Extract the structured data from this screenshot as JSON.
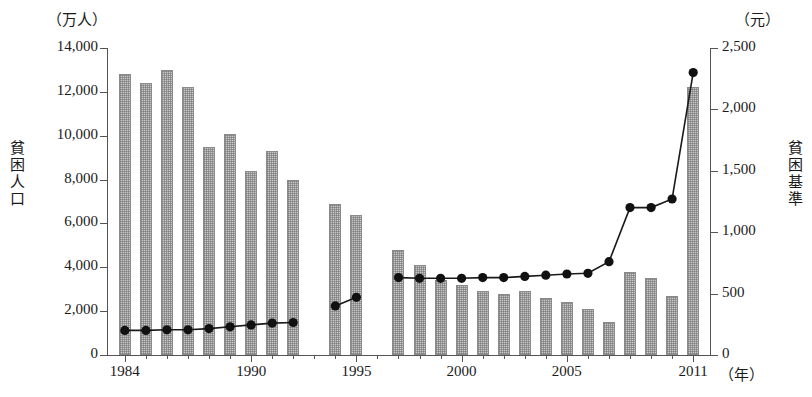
{
  "axes": {
    "left_unit": "（万人）",
    "right_unit": "（元）",
    "left_title": "貧困人口",
    "right_title": "貧困基準",
    "x_unit": "（年）",
    "left_ticks": [
      "14,000",
      "12,000",
      "10,000",
      "8,000",
      "6,000",
      "4,000",
      "2,000",
      "0"
    ],
    "right_ticks": [
      "2,500",
      "2,000",
      "1,500",
      "1,000",
      "500",
      "0"
    ],
    "x_ticks": [
      "1984",
      "1990",
      "1995",
      "2000",
      "2005",
      "2011"
    ]
  },
  "chart_data": {
    "type": "bar",
    "title": "",
    "xlabel": "年",
    "ylabel": "貧困人口",
    "y2label": "貧困基準",
    "ylim": [
      0,
      14000
    ],
    "y2lim": [
      0,
      2500
    ],
    "grid": false,
    "legend": "none",
    "x": [
      1984,
      1985,
      1986,
      1987,
      1988,
      1989,
      1990,
      1991,
      1992,
      1993,
      1994,
      1995,
      1996,
      1997,
      1998,
      1999,
      2000,
      2001,
      2002,
      2003,
      2004,
      2005,
      2006,
      2007,
      2008,
      2009,
      2010,
      2011
    ],
    "categories": [
      "1984",
      "1985",
      "1986",
      "1987",
      "1988",
      "1989",
      "1990",
      "1991",
      "1992",
      "1993",
      "1994",
      "1995",
      "1996",
      "1997",
      "1998",
      "1999",
      "2000",
      "2001",
      "2002",
      "2003",
      "2004",
      "2005",
      "2006",
      "2007",
      "2008",
      "2009",
      "2010",
      "2011"
    ],
    "series": [
      {
        "name": "貧困人口",
        "type": "bar",
        "axis": "left",
        "unit": "万人",
        "values": [
          12800,
          12400,
          13000,
          12200,
          9500,
          10100,
          8400,
          9300,
          8000,
          null,
          6900,
          6400,
          null,
          4800,
          4100,
          3400,
          3200,
          2900,
          2800,
          2900,
          2600,
          2400,
          2100,
          1500,
          3800,
          3500,
          2700,
          12200
        ]
      },
      {
        "name": "貧困基準",
        "type": "line",
        "axis": "right",
        "unit": "元",
        "values": [
          200,
          200,
          205,
          205,
          215,
          230,
          245,
          260,
          265,
          null,
          400,
          470,
          null,
          630,
          625,
          625,
          625,
          630,
          630,
          640,
          650,
          660,
          665,
          760,
          1200,
          1200,
          1270,
          2300
        ]
      }
    ]
  }
}
